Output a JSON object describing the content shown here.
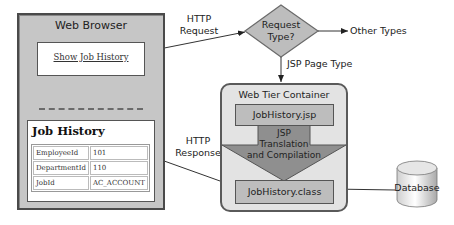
{
  "browser": {
    "title": "Web Browser",
    "link": "Show Job History",
    "result": {
      "title": "Job History",
      "rows": [
        {
          "key": "EmployeeId",
          "value": "101"
        },
        {
          "key": "DepartmentId",
          "value": "110"
        },
        {
          "key": "JobId",
          "value": "AC_ACCOUNT"
        }
      ]
    }
  },
  "labels": {
    "http_request_line1": "HTTP",
    "http_request_line2": "Request",
    "http_response_line1": "HTTP",
    "http_response_line2": "Response",
    "other_types": "Other Types",
    "jsp_page_type": "JSP Page Type"
  },
  "decision": {
    "line1": "Request",
    "line2": "Type?"
  },
  "container": {
    "title": "Web Tier Container",
    "jsp_file": "JobHistory.jsp",
    "translation_line1": "JSP",
    "translation_line2": "Translation",
    "translation_line3": "and Compilation",
    "class_file": "JobHistory.class"
  },
  "database": {
    "label": "Database"
  },
  "colors": {
    "frame_gray": "#c6c6c6",
    "container_fill": "#e3e3e3",
    "box_fill": "#bdbdbd",
    "arrow_fill": "#8f8f8f",
    "border": "#4a4a4a"
  }
}
